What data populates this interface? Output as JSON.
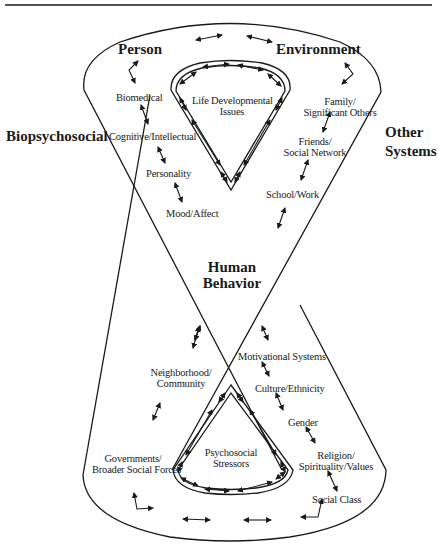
{
  "center_label": [
    "Human",
    "Behavior"
  ],
  "side_labels": {
    "left": "Biopsychosocial",
    "right": [
      "Other",
      "Systems"
    ]
  },
  "top_loop": {
    "headings": {
      "person": "Person",
      "environment": "Environment"
    },
    "inner_label": [
      "Life Developmental",
      "Issues"
    ],
    "left_items": [
      "Biomedical",
      "Cognitive/Intellectual",
      "Personality",
      "Mood/Affect"
    ],
    "right_items": [
      [
        "Family/",
        "Significant Others"
      ],
      [
        "Friends/",
        "Social Network"
      ],
      [
        "School/Work"
      ]
    ]
  },
  "bottom_loop": {
    "inner_label": [
      "Psychosocial",
      "Stressors"
    ],
    "left_items": [
      [
        "Neighborhood/",
        "Community"
      ],
      [
        "Governments/",
        "Broader Social Forces"
      ]
    ],
    "right_items": [
      [
        "Motivational Systems"
      ],
      [
        "Culture/Ethnicity"
      ],
      [
        "Gender"
      ],
      [
        "Religion/",
        "Spirituality/Values"
      ],
      [
        "Social Class"
      ]
    ]
  },
  "colors": {
    "line": "#1a1a1a",
    "background": "#ffffff"
  }
}
